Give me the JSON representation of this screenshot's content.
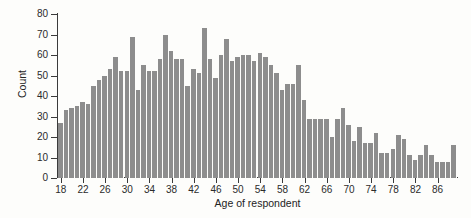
{
  "chart_data": {
    "type": "bar",
    "title": "",
    "xlabel": "Age of respondent",
    "ylabel": "Count",
    "xlim": [
      17.5,
      89.5
    ],
    "ylim": [
      0,
      80
    ],
    "grid": false,
    "legend": null,
    "bar_color": "#8d8d8d",
    "axis_color": "#3b3b3b",
    "background_color": "#fdfdfb",
    "y_ticks": [
      0,
      10,
      20,
      30,
      40,
      50,
      60,
      70,
      80
    ],
    "x_ticks": [
      18,
      22,
      26,
      30,
      34,
      38,
      42,
      46,
      50,
      54,
      58,
      62,
      66,
      70,
      74,
      78,
      82,
      86
    ],
    "bin_width": 1,
    "categories": [
      18,
      19,
      20,
      21,
      22,
      23,
      24,
      25,
      26,
      27,
      28,
      29,
      30,
      31,
      32,
      33,
      34,
      35,
      36,
      37,
      38,
      39,
      40,
      41,
      42,
      43,
      44,
      45,
      46,
      47,
      48,
      49,
      50,
      51,
      52,
      53,
      54,
      55,
      56,
      57,
      58,
      59,
      60,
      61,
      62,
      63,
      64,
      65,
      66,
      67,
      68,
      69,
      70,
      71,
      72,
      73,
      74,
      75,
      76,
      77,
      78,
      79,
      80,
      81,
      82,
      83,
      84,
      85,
      86,
      87,
      88,
      89
    ],
    "values": [
      27,
      33,
      34,
      35,
      37,
      36,
      45,
      48,
      50,
      53,
      59,
      52,
      52,
      69,
      43,
      55,
      52,
      52,
      58,
      70,
      62,
      58,
      58,
      45,
      53,
      51,
      73,
      58,
      49,
      60,
      68,
      57,
      59,
      60,
      60,
      57,
      61,
      59,
      55,
      51,
      43,
      46,
      46,
      55,
      38,
      29,
      29,
      29,
      29,
      20,
      29,
      34,
      26,
      18,
      25,
      17,
      17,
      22,
      12,
      12,
      14,
      21,
      19,
      11,
      9,
      11,
      16,
      11,
      8,
      8,
      8,
      16
    ]
  }
}
